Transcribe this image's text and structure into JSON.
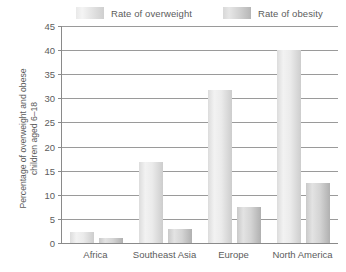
{
  "chart_data": {
    "type": "bar",
    "title": "",
    "xlabel": "",
    "ylabel": "Percentage of overweight and obese children aged 6-18",
    "ylabel_lines": [
      "Percentage of overweight and obese",
      "children aged 6–18"
    ],
    "categories": [
      "Africa",
      "Southeast Asia",
      "Europe",
      "North America"
    ],
    "series": [
      {
        "name": "Rate of overweight",
        "values": [
          2.3,
          16.7,
          31.7,
          40.0
        ],
        "color": "#e6e6e6"
      },
      {
        "name": "Rate of obesity",
        "values": [
          1.0,
          3.0,
          7.5,
          12.5
        ],
        "color": "#cccccc"
      }
    ],
    "ylim": [
      0,
      45
    ],
    "yticks": [
      0,
      5,
      10,
      15,
      20,
      25,
      30,
      35,
      40,
      45
    ],
    "ytick_labels": [
      "0",
      "5",
      "10",
      "15",
      "20",
      "25",
      "30",
      "35",
      "40",
      "45"
    ],
    "grid": true,
    "legend_position": "top"
  },
  "legend": {
    "entries": [
      {
        "label": "Rate of overweight",
        "swatch": "overweight-swatch"
      },
      {
        "label": "Rate of obesity",
        "swatch": "obesity-swatch"
      }
    ]
  }
}
